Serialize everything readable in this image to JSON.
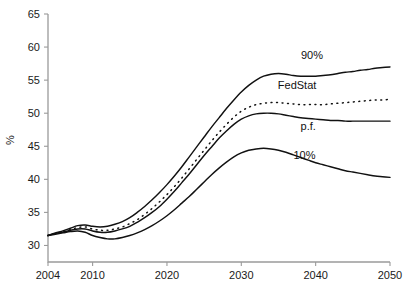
{
  "chart_data": {
    "type": "line",
    "title": "",
    "subtitle": "",
    "xlabel": "",
    "ylabel": "%",
    "xlim": [
      2004,
      2050
    ],
    "ylim": [
      27.5,
      65
    ],
    "grid": false,
    "legend_position": "inline-right-of-curves",
    "x_ticks": [
      2004,
      2010,
      2020,
      2030,
      2040,
      2050
    ],
    "y_ticks": [
      30,
      35,
      40,
      45,
      50,
      55,
      60,
      65
    ],
    "x": [
      2004,
      2005,
      2006,
      2007,
      2008,
      2009,
      2010,
      2011,
      2012,
      2013,
      2014,
      2015,
      2016,
      2017,
      2018,
      2019,
      2020,
      2021,
      2022,
      2023,
      2024,
      2025,
      2026,
      2027,
      2028,
      2029,
      2030,
      2031,
      2032,
      2033,
      2034,
      2035,
      2036,
      2037,
      2038,
      2039,
      2040,
      2041,
      2042,
      2043,
      2044,
      2045,
      2046,
      2047,
      2048,
      2049,
      2050
    ],
    "series": [
      {
        "name": "90%",
        "label": "90%",
        "style": "solid",
        "values": [
          31.5,
          31.9,
          32.2,
          32.6,
          33.0,
          33.1,
          32.9,
          32.8,
          32.9,
          33.2,
          33.6,
          34.2,
          35.0,
          35.9,
          36.9,
          38.0,
          39.2,
          40.5,
          41.9,
          43.4,
          44.9,
          46.4,
          47.9,
          49.3,
          50.7,
          52.0,
          53.2,
          54.2,
          55.0,
          55.6,
          55.9,
          56.0,
          55.9,
          55.7,
          55.6,
          55.6,
          55.6,
          55.7,
          55.8,
          56.0,
          56.2,
          56.3,
          56.5,
          56.6,
          56.8,
          56.9,
          57.0
        ]
      },
      {
        "name": "FedStat",
        "label": "FedStat",
        "style": "dotted",
        "values": [
          31.5,
          31.8,
          32.1,
          32.4,
          32.7,
          32.8,
          32.5,
          32.3,
          32.3,
          32.5,
          32.8,
          33.3,
          33.9,
          34.7,
          35.6,
          36.6,
          37.7,
          38.9,
          40.2,
          41.6,
          43.0,
          44.4,
          45.8,
          47.1,
          48.3,
          49.4,
          50.3,
          50.9,
          51.3,
          51.5,
          51.6,
          51.6,
          51.5,
          51.4,
          51.3,
          51.3,
          51.3,
          51.3,
          51.4,
          51.5,
          51.6,
          51.7,
          51.8,
          51.9,
          52.0,
          52.0,
          52.1
        ]
      },
      {
        "name": "p.f.",
        "label": "p.f.",
        "style": "solid",
        "values": [
          31.5,
          31.8,
          32.0,
          32.3,
          32.5,
          32.5,
          32.2,
          32.0,
          32.0,
          32.2,
          32.5,
          32.9,
          33.5,
          34.2,
          35.0,
          35.9,
          37.0,
          38.2,
          39.5,
          40.8,
          42.2,
          43.6,
          44.9,
          46.2,
          47.3,
          48.3,
          49.1,
          49.6,
          49.9,
          50.0,
          50.0,
          49.9,
          49.7,
          49.5,
          49.3,
          49.2,
          49.1,
          49.0,
          48.9,
          48.9,
          48.8,
          48.8,
          48.8,
          48.8,
          48.8,
          48.8,
          48.8
        ]
      },
      {
        "name": "10%",
        "label": "10%",
        "style": "solid",
        "values": [
          31.5,
          31.7,
          31.9,
          32.1,
          32.2,
          32.0,
          31.5,
          31.2,
          31.0,
          31.0,
          31.2,
          31.5,
          31.9,
          32.4,
          33.0,
          33.7,
          34.5,
          35.4,
          36.4,
          37.4,
          38.5,
          39.6,
          40.7,
          41.7,
          42.6,
          43.4,
          44.0,
          44.4,
          44.6,
          44.7,
          44.6,
          44.4,
          44.1,
          43.7,
          43.3,
          42.9,
          42.5,
          42.2,
          41.9,
          41.6,
          41.3,
          41.1,
          40.9,
          40.7,
          40.5,
          40.4,
          40.3
        ]
      }
    ],
    "annotations": [
      {
        "text": "90%",
        "x_year": 2039.5,
        "y_value": 58.2
      },
      {
        "text": "FedStat",
        "x_year": 2037.5,
        "y_value": 53.6
      },
      {
        "text": "p.f.",
        "x_year": 2039.0,
        "y_value": 47.5
      },
      {
        "text": "10%",
        "x_year": 2038.5,
        "y_value": 43.0
      }
    ]
  }
}
